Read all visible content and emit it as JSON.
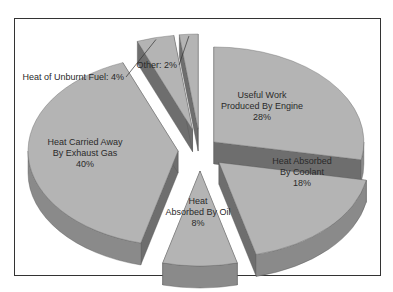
{
  "chart_data": {
    "type": "pie",
    "variant": "3d-exploded",
    "title": "",
    "slices": [
      {
        "label": "Useful Work Produced By Engine",
        "value": 28,
        "display": [
          "Useful Work",
          "Produced By Engine",
          "28%"
        ],
        "color": "#b4b4b4"
      },
      {
        "label": "Heat Absorbed By Coolant",
        "value": 18,
        "display": [
          "Heat Absorbed",
          "By Coolant",
          "18%"
        ],
        "color": "#b4b4b4"
      },
      {
        "label": "Heat Absorbed By Oil",
        "value": 8,
        "display": [
          "Heat",
          "Absorbed By Oil",
          "8%"
        ],
        "color": "#b4b4b4"
      },
      {
        "label": "Heat Carried Away By Exhaust Gas",
        "value": 40,
        "display": [
          "Heat Carried Away",
          "By Exhaust Gas",
          "40%"
        ],
        "color": "#b4b4b4"
      },
      {
        "label": "Heat of Unburnt Fuel",
        "value": 4,
        "display": [
          "Heat of Unburnt Fuel: 4%"
        ],
        "color": "#b4b4b4"
      },
      {
        "label": "Other",
        "value": 2,
        "display": [
          "Other: 2%"
        ],
        "color": "#b4b4b4"
      }
    ],
    "side_color": "#8a8a8a",
    "side_dark_color": "#6e6e6e",
    "legend": "none"
  }
}
